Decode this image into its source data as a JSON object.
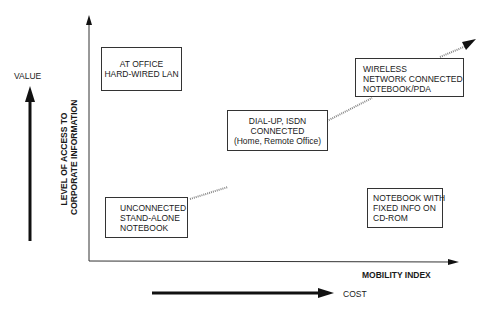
{
  "diagram": {
    "y_axis_label": [
      "LEVEL OF ACCESS TO",
      "CORPORATE  INFORMATION"
    ],
    "x_axis_label": "MOBILITY INDEX",
    "value_label": "VALUE",
    "cost_label": "COST",
    "boxes": {
      "at_office": [
        "AT OFFICE",
        "HARD-WIRED  LAN"
      ],
      "dialup": [
        "DIAL-UP, ISDN",
        "CONNECTED",
        "(Home, Remote Office)"
      ],
      "wireless": [
        "WIRELESS",
        "NETWORK CONNECTED",
        "NOTEBOOK/PDA"
      ],
      "unconnected": [
        "UNCONNECTED",
        "STAND-ALONE",
        "NOTEBOOK"
      ],
      "notebook_cdrom": [
        "NOTEBOOK WITH",
        "FIXED INFO ON",
        "CD-ROM"
      ]
    },
    "colors": {
      "ink": "#1a1a1a",
      "dotted": "#888888",
      "background": "#ffffff"
    }
  }
}
